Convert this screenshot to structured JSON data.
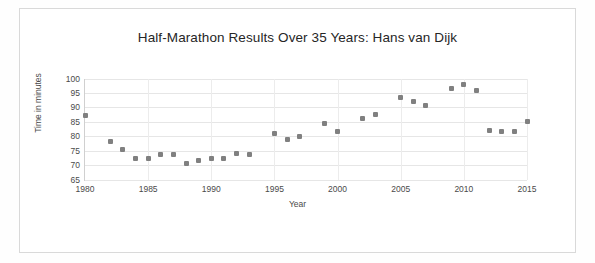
{
  "chart_data": {
    "type": "scatter",
    "title": "Half-Marathon Results Over 35 Years: Hans van Dijk",
    "xlabel": "Year",
    "ylabel": "Time in minutes",
    "xlim": [
      1980,
      2015
    ],
    "ylim": [
      65,
      100
    ],
    "xticks": [
      1980,
      1985,
      1990,
      1995,
      2000,
      2005,
      2010,
      2015
    ],
    "yticks": [
      65,
      70,
      75,
      80,
      85,
      90,
      95,
      100
    ],
    "grid": "horizontal-and-vertical",
    "legend": "none",
    "marker_color": "#808080",
    "series": [
      {
        "name": "Half-marathon time",
        "points": [
          {
            "x": 1980,
            "y": 87.3
          },
          {
            "x": 1982,
            "y": 78.0
          },
          {
            "x": 1983,
            "y": 75.3
          },
          {
            "x": 1984,
            "y": 72.3
          },
          {
            "x": 1985,
            "y": 72.4
          },
          {
            "x": 1986,
            "y": 73.5
          },
          {
            "x": 1987,
            "y": 73.6
          },
          {
            "x": 1988,
            "y": 70.5
          },
          {
            "x": 1989,
            "y": 71.5
          },
          {
            "x": 1990,
            "y": 72.4
          },
          {
            "x": 1991,
            "y": 72.3
          },
          {
            "x": 1992,
            "y": 74.0
          },
          {
            "x": 1993,
            "y": 73.5
          },
          {
            "x": 1995,
            "y": 81.0
          },
          {
            "x": 1996,
            "y": 79.0
          },
          {
            "x": 1997,
            "y": 80.0
          },
          {
            "x": 1999,
            "y": 84.5
          },
          {
            "x": 2000,
            "y": 81.5
          },
          {
            "x": 2002,
            "y": 86.0
          },
          {
            "x": 2003,
            "y": 87.5
          },
          {
            "x": 2005,
            "y": 93.5
          },
          {
            "x": 2006,
            "y": 92.0
          },
          {
            "x": 2007,
            "y": 90.5
          },
          {
            "x": 2009,
            "y": 96.5
          },
          {
            "x": 2010,
            "y": 98.0
          },
          {
            "x": 2011,
            "y": 96.0
          },
          {
            "x": 2012,
            "y": 82.0
          },
          {
            "x": 2013,
            "y": 81.5
          },
          {
            "x": 2014,
            "y": 81.5
          },
          {
            "x": 2015,
            "y": 85.0
          }
        ]
      }
    ]
  }
}
